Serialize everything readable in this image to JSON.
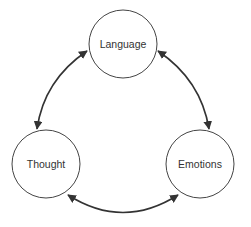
{
  "diagram": {
    "type": "cycle",
    "nodes": [
      {
        "id": "language",
        "label": "Language"
      },
      {
        "id": "thought",
        "label": "Thought"
      },
      {
        "id": "emotions",
        "label": "Emotions"
      }
    ],
    "edges": [
      {
        "from": "language",
        "to": "thought",
        "direction": "bidirectional"
      },
      {
        "from": "language",
        "to": "emotions",
        "direction": "bidirectional"
      },
      {
        "from": "thought",
        "to": "emotions",
        "direction": "bidirectional"
      }
    ],
    "colors": {
      "stroke": "#333333",
      "circle_stroke": "#444444",
      "background": "#ffffff"
    }
  }
}
